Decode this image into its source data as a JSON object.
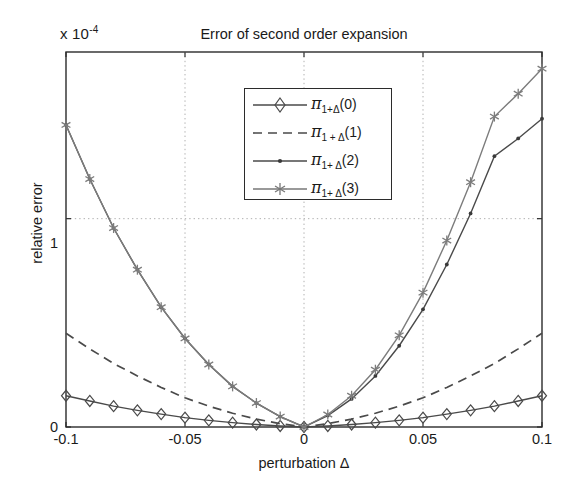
{
  "figure": {
    "title": "Error of second order expansion",
    "exponent_label_prefix": "x 10",
    "exponent_label_power": "-4",
    "xlabel": "perturbation Δ",
    "ylabel": "relative error",
    "xticks": [
      "-0.1",
      "-0.05",
      "0",
      "0.05",
      "0.1"
    ],
    "yticks": [
      "0",
      "1"
    ],
    "grid_color": "#b0b0b0",
    "axis_color": "#2b2b2b",
    "line_color": "#4a4a4a"
  },
  "legend": {
    "entries": [
      {
        "label_pi": "π",
        "label_sub": "1+Δ",
        "label_order": "(0)",
        "marker": "diamond-marker",
        "style": "solid"
      },
      {
        "label_pi": "π",
        "label_sub": "1 + Δ",
        "label_order": "(1)",
        "marker": "none",
        "style": "dashed"
      },
      {
        "label_pi": "π",
        "label_sub": "1+ Δ",
        "label_order": "(2)",
        "marker": "dot-marker",
        "style": "solid"
      },
      {
        "label_pi": "π",
        "label_sub": "1+ Δ",
        "label_order": "(3)",
        "marker": "asterisk-marker",
        "style": "solid"
      }
    ]
  },
  "chart_data": {
    "type": "line",
    "title": "Error of second order expansion",
    "xlabel": "perturbation Δ",
    "ylabel": "relative error",
    "y_multiplier": "1e-4",
    "xlim": [
      -0.1,
      0.1
    ],
    "ylim": [
      0,
      1.8
    ],
    "grid": true,
    "legend_position": "upper center",
    "x": [
      -0.1,
      -0.09,
      -0.08,
      -0.07,
      -0.06,
      -0.05,
      -0.04,
      -0.03,
      -0.02,
      -0.01,
      0,
      0.01,
      0.02,
      0.03,
      0.04,
      0.05,
      0.06,
      0.07,
      0.08,
      0.09,
      0.1
    ],
    "series": [
      {
        "name": "pi_1+D_(0)",
        "marker": "diamond",
        "style": "solid",
        "values": [
          0.15,
          0.125,
          0.1,
          0.08,
          0.062,
          0.045,
          0.032,
          0.021,
          0.012,
          0.005,
          0.0,
          0.005,
          0.012,
          0.021,
          0.032,
          0.045,
          0.062,
          0.08,
          0.1,
          0.125,
          0.15
        ]
      },
      {
        "name": "pi_1+D_(1)",
        "marker": "none",
        "style": "dashed",
        "values": [
          0.45,
          0.375,
          0.305,
          0.245,
          0.19,
          0.14,
          0.1,
          0.066,
          0.038,
          0.016,
          0.0,
          0.016,
          0.038,
          0.066,
          0.1,
          0.14,
          0.19,
          0.245,
          0.305,
          0.375,
          0.45
        ]
      },
      {
        "name": "pi_1+D_(2)",
        "marker": "dot",
        "style": "solid",
        "values": [
          1.45,
          1.19,
          0.955,
          0.755,
          0.575,
          0.425,
          0.3,
          0.195,
          0.115,
          0.05,
          0.0,
          0.055,
          0.135,
          0.245,
          0.39,
          0.565,
          0.78,
          1.025,
          1.3,
          1.385,
          1.48
        ]
      },
      {
        "name": "pi_1+D_(3)",
        "marker": "asterisk",
        "style": "solid",
        "values": [
          1.45,
          1.19,
          0.955,
          0.755,
          0.575,
          0.425,
          0.3,
          0.195,
          0.115,
          0.05,
          0.0,
          0.06,
          0.15,
          0.275,
          0.44,
          0.645,
          0.895,
          1.175,
          1.49,
          1.6,
          1.72
        ]
      }
    ]
  }
}
